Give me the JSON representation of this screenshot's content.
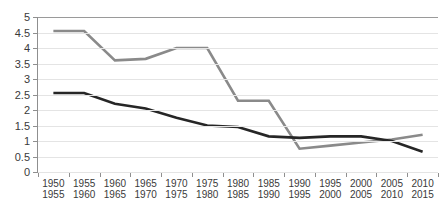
{
  "chart_data": {
    "type": "line",
    "title": "",
    "xlabel": "",
    "ylabel": "",
    "ylim": [
      0,
      5
    ],
    "ytick_step": 0.5,
    "grid": true,
    "legend": "none",
    "categories": [
      "1950\n1955",
      "1955\n1960",
      "1960\n1965",
      "1965\n1970",
      "1970\n1975",
      "1975\n1980",
      "1980\n1985",
      "1985\n1990",
      "1990\n1995",
      "1995\n2000",
      "2000\n2005",
      "2005\n2010",
      "2010\n2015"
    ],
    "category_lines": [
      {
        "top": "1950",
        "bottom": "1955"
      },
      {
        "top": "1955",
        "bottom": "1960"
      },
      {
        "top": "1960",
        "bottom": "1965"
      },
      {
        "top": "1965",
        "bottom": "1970"
      },
      {
        "top": "1970",
        "bottom": "1975"
      },
      {
        "top": "1975",
        "bottom": "1980"
      },
      {
        "top": "1980",
        "bottom": "1985"
      },
      {
        "top": "1985",
        "bottom": "1990"
      },
      {
        "top": "1990",
        "bottom": "1995"
      },
      {
        "top": "1995",
        "bottom": "2000"
      },
      {
        "top": "2000",
        "bottom": "2005"
      },
      {
        "top": "2005",
        "bottom": "2010"
      },
      {
        "top": "2010",
        "bottom": "2015"
      }
    ],
    "yticks": [
      "0",
      "0.5",
      "1",
      "1.5",
      "2",
      "2.5",
      "3",
      "3.5",
      "4",
      "4.5",
      "5"
    ],
    "ytick_values": [
      0,
      0.5,
      1,
      1.5,
      2,
      2.5,
      3,
      3.5,
      4,
      4.5,
      5
    ],
    "series": [
      {
        "name": "gray-series",
        "color": "#8a8a8a",
        "width": 2.6,
        "values": [
          4.55,
          4.55,
          3.6,
          3.65,
          4.0,
          4.0,
          2.3,
          2.3,
          0.75,
          0.85,
          0.95,
          1.05,
          1.2
        ]
      },
      {
        "name": "dark-series",
        "color": "#262626",
        "width": 2.6,
        "values": [
          2.55,
          2.55,
          2.2,
          2.05,
          1.75,
          1.5,
          1.45,
          1.15,
          1.1,
          1.15,
          1.15,
          1.0,
          0.65
        ]
      }
    ]
  },
  "colors": {
    "gray_series": "#8a8a8a",
    "dark_series": "#262626",
    "gridline": "#e4e4e4",
    "axis": "#8f8f8f",
    "text": "#3a3a3a",
    "background": "#ffffff"
  }
}
